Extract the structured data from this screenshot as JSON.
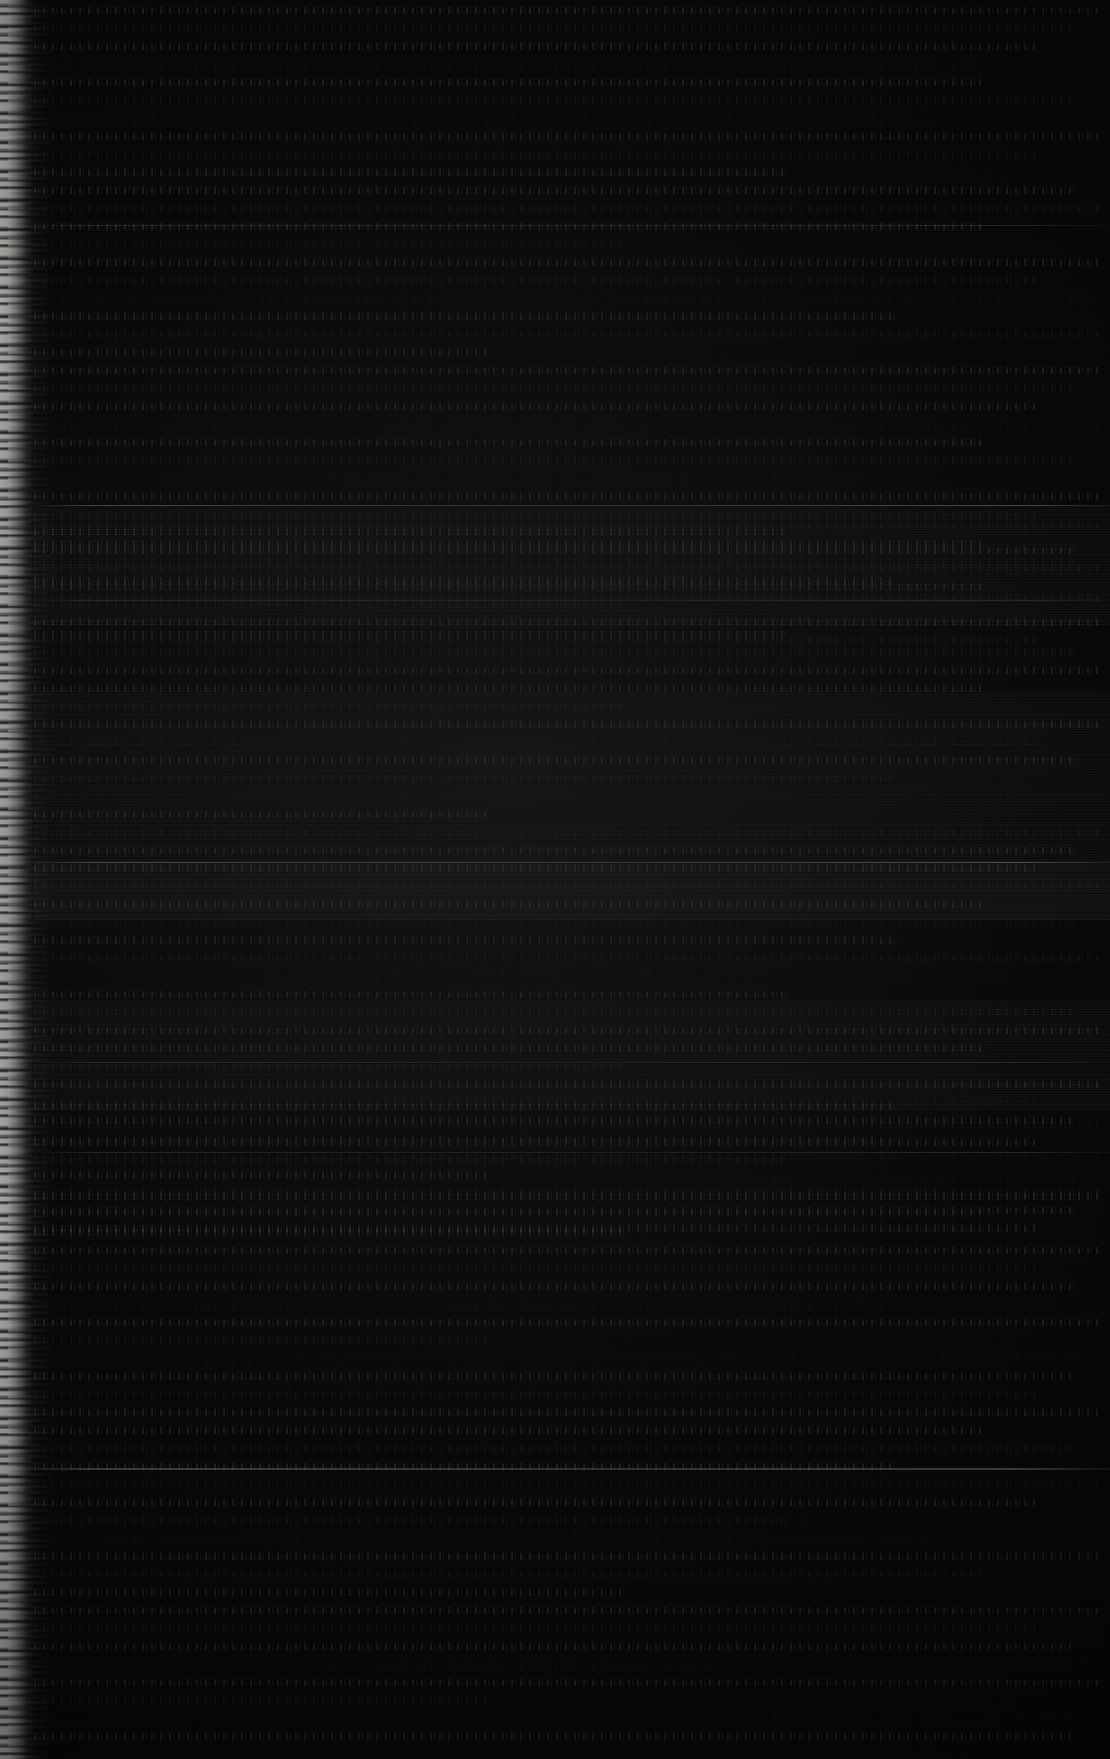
{
  "document": {
    "description": "Severely underexposed scanned page",
    "legible_text": "",
    "page_background_color": "#050505",
    "ink_color": "#bebeb9",
    "torn_edge_color": "#e9e9e6",
    "width_px": 1110,
    "height_px": 1759
  },
  "structure": {
    "left_margin_px": 34,
    "text_line_height_px": 13,
    "text_line_gap_px": 5,
    "rules": [
      225,
      505,
      600,
      862,
      1062,
      1152,
      1468
    ],
    "sections": [
      {
        "name": "upper-text-block",
        "top": 0,
        "lines": 37
      },
      {
        "name": "middle-striped-block",
        "top": 520,
        "lines": 40
      },
      {
        "name": "lower-text-block",
        "top": 1100,
        "lines": 36
      }
    ]
  },
  "regions": {
    "header_label": "",
    "body_label": "",
    "footer_label": ""
  }
}
